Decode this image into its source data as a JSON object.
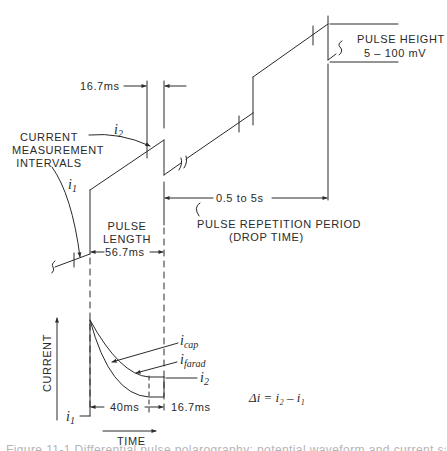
{
  "top_diagram": {
    "interval_width_label": "16.7ms",
    "current_measurement_label": [
      "CURRENT",
      "MEASUREMENT",
      "INTERVALS"
    ],
    "i1_label": "i",
    "i1_sub": "1",
    "i2_label": "i",
    "i2_sub": "2",
    "pulse_height_label": "PULSE HEIGHT",
    "pulse_height_value": "5 – 100 mV",
    "repetition_value": "0.5 to 5s",
    "repetition_label": "PULSE REPETITION PERIOD",
    "drop_time_label": "(DROP TIME)",
    "pulse_length_label": [
      "PULSE",
      "LENGTH"
    ],
    "pulse_length_value": "56.7ms"
  },
  "bottom_diagram": {
    "y_axis_label": "CURRENT",
    "x_axis_label": "TIME",
    "icap_label": "i",
    "icap_sub": "cap",
    "ifarad_label": "i",
    "ifarad_sub": "farad",
    "i2_label": "i",
    "i2_sub": "2",
    "i1_label": "i",
    "i1_sub": "1",
    "interval_40_label": "40ms",
    "interval_167_label": "16.7ms",
    "delta_equation": "Δi = i₂ – i₁"
  },
  "caption": "Figure 11-1 Differential pulse polarography: potential waveform and current sampling",
  "colors": {
    "ink": "#2a2a2a",
    "background": "#ffffff",
    "caption": "#b5b5b5"
  }
}
